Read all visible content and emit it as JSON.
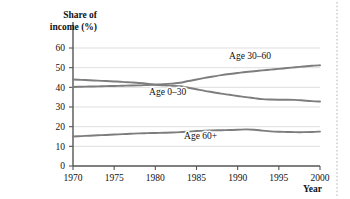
{
  "chart_data": {
    "type": "line",
    "title": "",
    "xlabel": "Year",
    "ylabel": "Share of income (%)",
    "ylabel_line1": "Share of",
    "ylabel_line2": "income (%)",
    "xlim": [
      1970,
      2000
    ],
    "ylim": [
      0,
      60
    ],
    "xticks": [
      1970,
      1975,
      1980,
      1985,
      1990,
      1995,
      2000
    ],
    "xtick_labels": [
      "1970",
      "1975",
      "1980",
      "1985",
      "1990",
      "1995",
      "2000"
    ],
    "yticks": [
      0,
      10,
      20,
      30,
      40,
      50,
      60
    ],
    "ytick_labels": [
      "0",
      "10",
      "20",
      "30",
      "40",
      "50",
      "60"
    ],
    "grid": "horizontal",
    "legend_position": "inline-labels",
    "line_color": "#7d7d7d",
    "x": [
      1970,
      1971,
      1972,
      1973,
      1974,
      1975,
      1976,
      1977,
      1978,
      1979,
      1980,
      1981,
      1982,
      1983,
      1984,
      1985,
      1986,
      1987,
      1988,
      1989,
      1990,
      1991,
      1992,
      1993,
      1994,
      1995,
      1996,
      1997,
      1998,
      1999,
      2000
    ],
    "series": [
      {
        "name": "Age 0–30",
        "label": "Age 0–30",
        "label_x": 1981.5,
        "label_y": 36.0,
        "color": "#7d7d7d",
        "values": [
          44.0,
          43.8,
          43.6,
          43.4,
          43.2,
          43.0,
          42.8,
          42.5,
          42.2,
          41.8,
          41.3,
          41.0,
          40.8,
          40.6,
          39.8,
          39.0,
          38.2,
          37.5,
          36.8,
          36.2,
          35.6,
          35.0,
          34.5,
          34.0,
          33.8,
          33.7,
          33.7,
          33.6,
          33.3,
          33.0,
          32.8
        ]
      },
      {
        "name": "Age 30–60",
        "label": "Age 30–60",
        "label_x": 1991.5,
        "label_y": 54.5,
        "color": "#7d7d7d",
        "values": [
          40.2,
          40.3,
          40.4,
          40.5,
          40.6,
          40.7,
          40.8,
          40.9,
          41.0,
          41.2,
          41.4,
          41.6,
          41.9,
          42.3,
          43.2,
          44.0,
          44.8,
          45.5,
          46.2,
          46.8,
          47.3,
          47.8,
          48.2,
          48.6,
          49.0,
          49.4,
          49.8,
          50.2,
          50.6,
          51.0,
          51.2
        ]
      },
      {
        "name": "Age 60+",
        "label": "Age 60+",
        "label_x": 1985.5,
        "label_y": 13.5,
        "color": "#7d7d7d",
        "values": [
          15.0,
          15.2,
          15.4,
          15.6,
          15.8,
          16.0,
          16.2,
          16.4,
          16.6,
          16.7,
          16.8,
          16.9,
          17.0,
          17.2,
          17.5,
          17.8,
          18.0,
          18.1,
          18.2,
          18.3,
          18.4,
          18.6,
          18.4,
          18.0,
          17.6,
          17.4,
          17.3,
          17.2,
          17.2,
          17.3,
          17.5
        ]
      }
    ]
  }
}
